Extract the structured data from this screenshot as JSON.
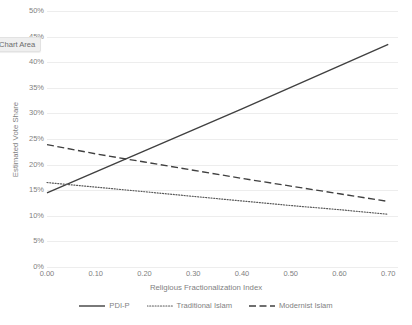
{
  "tooltip": {
    "label": "Chart Area"
  },
  "chart_data": {
    "type": "line",
    "title": "",
    "xlabel": "Religious Fractionalization Index",
    "ylabel": "Estimated Vote Share",
    "xlim": [
      0.0,
      0.72
    ],
    "ylim": [
      0,
      50
    ],
    "grid": true,
    "legend_position": "bottom",
    "x_ticks": [
      "0.00",
      "0.10",
      "0.20",
      "0.30",
      "0.40",
      "0.50",
      "0.60",
      "0.70"
    ],
    "x_tick_values": [
      0.0,
      0.1,
      0.2,
      0.3,
      0.4,
      0.5,
      0.6,
      0.7
    ],
    "y_ticks": [
      "0%",
      "5%",
      "10%",
      "15%",
      "20%",
      "25%",
      "30%",
      "35%",
      "40%",
      "45%",
      "50%"
    ],
    "y_tick_values": [
      0,
      5,
      10,
      15,
      20,
      25,
      30,
      35,
      40,
      45,
      50
    ],
    "x": [
      0.0,
      0.1,
      0.2,
      0.3,
      0.4,
      0.5,
      0.6,
      0.7
    ],
    "series": [
      {
        "name": "PDI-P",
        "style": "solid",
        "color": "#404040",
        "values": [
          14.5,
          18.6,
          22.7,
          26.8,
          30.9,
          35.1,
          39.3,
          43.5
        ]
      },
      {
        "name": "Traditional Islam",
        "style": "dotted",
        "color": "#595959",
        "values": [
          16.5,
          15.6,
          14.7,
          13.8,
          12.9,
          12.0,
          11.2,
          10.3
        ]
      },
      {
        "name": "Modernist Islam",
        "style": "dashed",
        "color": "#404040",
        "values": [
          23.9,
          22.1,
          20.5,
          18.9,
          17.3,
          15.8,
          14.3,
          12.8
        ]
      }
    ]
  }
}
